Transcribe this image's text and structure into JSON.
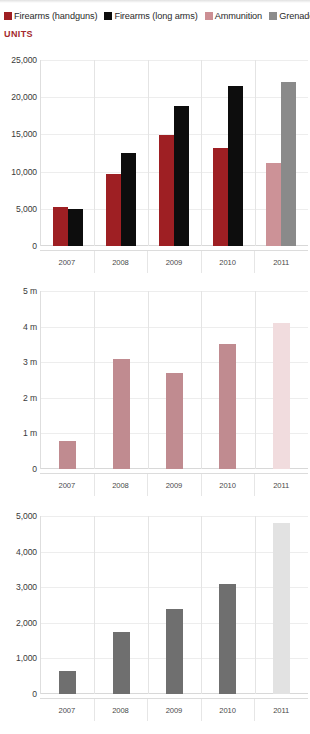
{
  "legend": {
    "items": [
      {
        "label": "Firearms (handguns)",
        "color": "#9e1f23",
        "icon": "square-swatch-icon"
      },
      {
        "label": "Firearms (long arms)",
        "color": "#0d0d0d",
        "icon": "square-swatch-icon"
      },
      {
        "label": "Ammunition",
        "color": "#cc8f94",
        "icon": "square-swatch-icon"
      },
      {
        "label": "Grenades",
        "color": "#8c8c8c",
        "icon": "square-swatch-icon"
      }
    ]
  },
  "units_caption": "UNITS",
  "colors": {
    "handguns": "#9e1f23",
    "long_arms": "#0d0d0d",
    "ammunition": "#c08b90",
    "ammunition_light": "#f1dcde",
    "grenades": "#6f6f6f",
    "grenades_light": "#e2e2e2",
    "handguns_light": "#cc9297",
    "long_arms_light": "#8a8a8a",
    "accent_red": "#a4282c",
    "grid": "#ededed",
    "text": "#3a3a3a"
  },
  "chart_data": [
    {
      "id": "firearms",
      "type": "bar",
      "title": "UNITS",
      "xlabel": "",
      "ylabel": "UNITS",
      "grid": true,
      "legend_position": "top",
      "categories": [
        "2007",
        "2008",
        "2009",
        "2010",
        "2011"
      ],
      "ylim": [
        0,
        25000
      ],
      "yticks": [
        0,
        5000,
        10000,
        15000,
        20000,
        25000
      ],
      "ytick_labels": [
        "0",
        "5,000",
        "10,000",
        "15,000",
        "20,000",
        "25,000"
      ],
      "series": [
        {
          "name": "Firearms (handguns)",
          "values": [
            5300,
            9700,
            14900,
            13200,
            11100
          ],
          "colors": [
            "#9e1f23",
            "#9e1f23",
            "#9e1f23",
            "#9e1f23",
            "#cc9297"
          ]
        },
        {
          "name": "Firearms (long arms)",
          "values": [
            5000,
            12500,
            18800,
            21500,
            22100
          ],
          "colors": [
            "#0d0d0d",
            "#0d0d0d",
            "#0d0d0d",
            "#0d0d0d",
            "#8a8a8a"
          ]
        }
      ]
    },
    {
      "id": "ammunition",
      "type": "bar",
      "title": "",
      "xlabel": "",
      "ylabel": "",
      "grid": true,
      "legend_position": "none",
      "categories": [
        "2007",
        "2008",
        "2009",
        "2010",
        "2011"
      ],
      "ylim": [
        0,
        5000000
      ],
      "yticks": [
        0,
        1000000,
        2000000,
        3000000,
        4000000,
        5000000
      ],
      "ytick_labels": [
        "0",
        "1 m",
        "2 m",
        "3 m",
        "4 m",
        "5 m"
      ],
      "series": [
        {
          "name": "Ammunition",
          "values": [
            800000,
            3100000,
            2700000,
            3500000,
            4100000
          ],
          "colors": [
            "#c08b90",
            "#c08b90",
            "#c08b90",
            "#c08b90",
            "#f1dcde"
          ]
        }
      ]
    },
    {
      "id": "grenades",
      "type": "bar",
      "title": "",
      "xlabel": "",
      "ylabel": "",
      "grid": true,
      "legend_position": "none",
      "categories": [
        "2007",
        "2008",
        "2009",
        "2010",
        "2011"
      ],
      "ylim": [
        0,
        5000
      ],
      "yticks": [
        0,
        1000,
        2000,
        3000,
        4000,
        5000
      ],
      "ytick_labels": [
        "0",
        "1,000",
        "2,000",
        "3,000",
        "4,000",
        "5,000"
      ],
      "series": [
        {
          "name": "Grenades",
          "values": [
            650,
            1750,
            2400,
            3100,
            4800
          ],
          "colors": [
            "#6f6f6f",
            "#6f6f6f",
            "#6f6f6f",
            "#6f6f6f",
            "#e2e2e2"
          ]
        }
      ]
    }
  ],
  "layout": {
    "panels": [
      {
        "id": "firearms",
        "top": 44,
        "plot_top": 16,
        "plot_height": 186,
        "xlabels_top": 248
      },
      {
        "id": "ammunition",
        "top": 283,
        "plot_top": 8,
        "plot_height": 178,
        "xlabels_top": 472
      },
      {
        "id": "grenades",
        "top": 508,
        "plot_top": 8,
        "plot_height": 178,
        "xlabels_top": 697
      }
    ]
  }
}
